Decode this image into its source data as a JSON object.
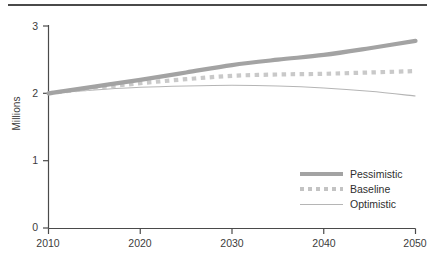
{
  "chart_data": {
    "type": "line",
    "title": "",
    "xlabel": "",
    "ylabel": "Millions",
    "xlim": [
      2010,
      2050
    ],
    "ylim": [
      0,
      3
    ],
    "grid": false,
    "legend_position": "bottom-right",
    "xticks": [
      "2010",
      "2020",
      "2030",
      "2040",
      "2050"
    ],
    "yticks": [
      "0",
      "1",
      "2",
      "3"
    ],
    "x": [
      2010,
      2015,
      2020,
      2025,
      2030,
      2035,
      2040,
      2045,
      2050
    ],
    "series": [
      {
        "name": "Pessimistic",
        "style": "thick-solid",
        "color": "#a3a3a3",
        "values": [
          2.0,
          2.1,
          2.2,
          2.31,
          2.42,
          2.5,
          2.57,
          2.67,
          2.78
        ]
      },
      {
        "name": "Baseline",
        "style": "dotted",
        "color": "#c9c9c9",
        "values": [
          2.0,
          2.08,
          2.15,
          2.21,
          2.26,
          2.28,
          2.29,
          2.31,
          2.33
        ]
      },
      {
        "name": "Optimistic",
        "style": "thin-solid",
        "color": "#b5b5b5",
        "values": [
          2.0,
          2.05,
          2.09,
          2.11,
          2.12,
          2.11,
          2.08,
          2.03,
          1.96
        ]
      }
    ]
  },
  "axes": {
    "ylabel": "Millions",
    "yticks": [
      {
        "label": "3",
        "value": 3
      },
      {
        "label": "2",
        "value": 2
      },
      {
        "label": "1",
        "value": 1
      },
      {
        "label": "0",
        "value": 0
      }
    ],
    "xticks": [
      {
        "label": "2010",
        "value": 2010
      },
      {
        "label": "2020",
        "value": 2020
      },
      {
        "label": "2030",
        "value": 2030
      },
      {
        "label": "2040",
        "value": 2040
      },
      {
        "label": "2050",
        "value": 2050
      }
    ]
  },
  "legend": {
    "items": [
      {
        "label": "Pessimistic"
      },
      {
        "label": "Baseline"
      },
      {
        "label": "Optimistic"
      }
    ]
  },
  "colors": {
    "axis": "#4a4a4a",
    "text": "#3c3c3c",
    "pessimistic": "#a3a3a3",
    "baseline": "#c9c9c9",
    "optimistic": "#b5b5b5",
    "rule": "#4a4a4a"
  }
}
